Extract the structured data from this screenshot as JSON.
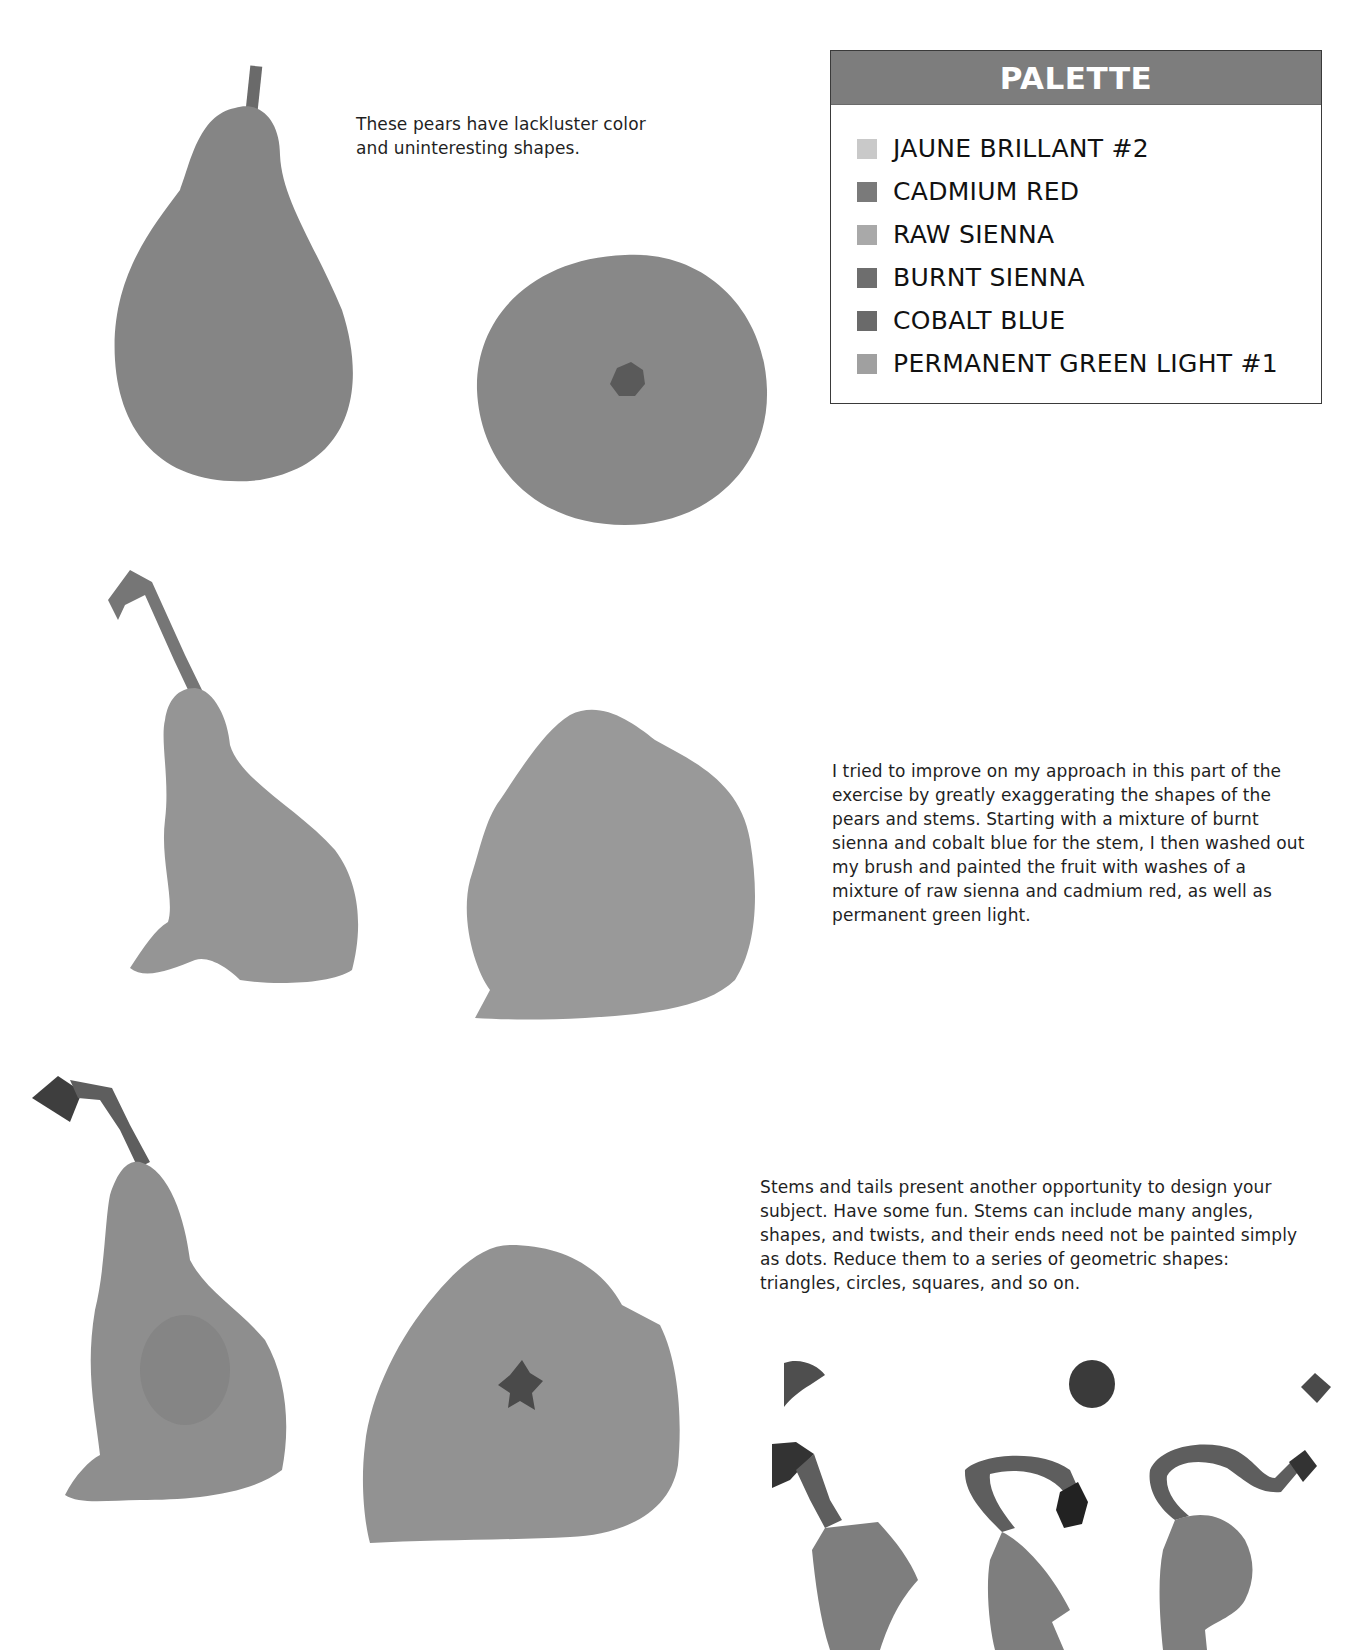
{
  "palette": {
    "title": "PALETTE",
    "items": [
      {
        "label": "JAUNE BRILLANT #2",
        "swatch": "#c9c9c9"
      },
      {
        "label": "CADMIUM RED",
        "swatch": "#7a7a7a"
      },
      {
        "label": "RAW SIENNA",
        "swatch": "#a9a9a9"
      },
      {
        "label": "BURNT SIENNA",
        "swatch": "#6e6e6e"
      },
      {
        "label": "COBALT BLUE",
        "swatch": "#6a6a6a"
      },
      {
        "label": "PERMANENT GREEN LIGHT #1",
        "swatch": "#a0a0a0"
      }
    ]
  },
  "captions": {
    "first": "These pears have lackluster color and uninteresting shapes.",
    "second": "I tried to improve on my approach in this part of the exercise by greatly exaggerating the shapes of the pears and stems. Starting with a mixture of burnt sienna and cobalt blue for the stem, I then washed out my brush and painted the fruit with washes of a mixture of raw sienna and cadmium red, as well as permanent green light.",
    "third": "Stems and tails present another opportunity to design your subject. Have some fun. Stems can include many angles, shapes, and twists, and their ends need not be painted simply as dots. Reduce them to a series of geometric shapes: triangles, circles, squares, and so on."
  },
  "colors": {
    "fruit_flat": "#858585",
    "fruit_light": "#9c9c9c",
    "fruit_mid": "#8f8f8f",
    "stem_dark": "#3e3e3e",
    "stem_mid": "#5e5e5e",
    "header_bg": "#7d7d7d"
  }
}
